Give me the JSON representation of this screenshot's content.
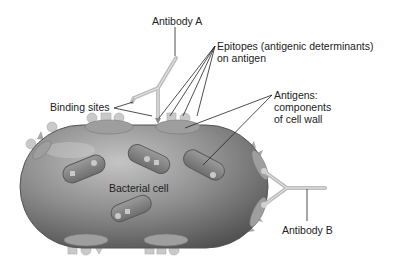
{
  "diagram": {
    "labels": {
      "antibody_a": "Antibody A",
      "epitopes_line1": "Epitopes (antigenic determinants)",
      "epitopes_line2": "on antigen",
      "antigens_line1": "Antigens:",
      "antigens_line2": "components",
      "antigens_line3": "of cell wall",
      "binding_sites": "Binding sites",
      "bacterial_cell": "Bacterial cell",
      "antibody_b": "Antibody B"
    },
    "colors": {
      "cell_fill": "#8c8c8c",
      "cell_highlight": "#bdbdbd",
      "cell_shadow": "#5a5a5a",
      "antibody": "#c8c8c8",
      "leader_line": "#222222",
      "text": "#222222"
    }
  }
}
